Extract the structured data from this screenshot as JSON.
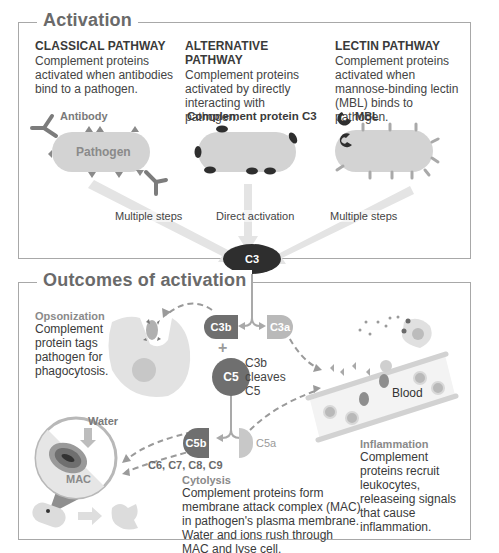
{
  "activation": {
    "title": "Activation",
    "pathways": [
      {
        "title": "CLASSICAL PATHWAY",
        "description": "Complement proteins activated when antibodies bind to a pathogen.",
        "illustration_labels": [
          "Antibody",
          "Pathogen"
        ],
        "arrow_label": "Multiple steps"
      },
      {
        "title": "ALTERNATIVE PATHWAY",
        "description": "Complement proteins activated by directly interacting with pathogen.",
        "illustration_labels": [
          "Complement protein C3"
        ],
        "arrow_label": "Direct activation"
      },
      {
        "title": "LECTIN PATHWAY",
        "description": "Complement proteins activated when mannose-binding lectin (MBL) binds to pathogen.",
        "illustration_labels": [
          "MBL"
        ],
        "arrow_label": "Multiple steps"
      }
    ]
  },
  "central_node": {
    "label": "C3"
  },
  "outcomes": {
    "title": "Outcomes of activation",
    "molecules": {
      "c3b": "C3b",
      "c3a": "C3a",
      "plus": "+",
      "c5": "C5",
      "c5b": "C5b",
      "c5a": "C5a",
      "cleave_note": "C3b cleaves C5",
      "mac_components": "C6, C7, C8, C9"
    },
    "opsonization": {
      "title": "Opsonization",
      "description": "Complement protein tags pathogen for phagocytosis."
    },
    "cytolysis": {
      "title": "Cytolysis",
      "description": "Complement proteins form membrane attack complex (MAC) in pathogen's plasma membrane. Water and ions rush through MAC and lyse cell.",
      "labels": {
        "water": "Water",
        "mac": "MAC"
      }
    },
    "inflammation": {
      "title": "Inflammation",
      "description": "Complement proteins recruit leukocytes, releaseing signals that cause inflammation.",
      "labels": {
        "blood": "Blood"
      }
    }
  },
  "colors": {
    "dark_node": "#2e2e2e",
    "c3b": "#6f6f6f",
    "c3a": "#b9b9b9",
    "pathogen": "#d3d3d3",
    "frame": "#a8a8a8",
    "heading": "#6a6a6a"
  }
}
